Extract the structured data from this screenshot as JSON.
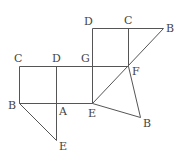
{
  "diagram": {
    "type": "geometry-figure",
    "labels": [
      {
        "id": "C1",
        "text": "C",
        "x": 14,
        "y": 53
      },
      {
        "id": "D1",
        "text": "D",
        "x": 52,
        "y": 53
      },
      {
        "id": "G",
        "text": "G",
        "x": 81,
        "y": 53
      },
      {
        "id": "B1",
        "text": "B",
        "x": 8,
        "y": 100
      },
      {
        "id": "A",
        "text": "A",
        "x": 59,
        "y": 106
      },
      {
        "id": "E1",
        "text": "E",
        "x": 88,
        "y": 108
      },
      {
        "id": "E2",
        "text": "E",
        "x": 59,
        "y": 141
      },
      {
        "id": "D2",
        "text": "D",
        "x": 84,
        "y": 16
      },
      {
        "id": "C2",
        "text": "C",
        "x": 124,
        "y": 15
      },
      {
        "id": "B2",
        "text": "B",
        "x": 166,
        "y": 23
      },
      {
        "id": "F",
        "text": "F",
        "x": 132,
        "y": 66
      },
      {
        "id": "B3",
        "text": "B",
        "x": 143,
        "y": 118
      }
    ],
    "segments": [
      {
        "from": [
          19,
          66
        ],
        "to": [
          128,
          66
        ]
      },
      {
        "from": [
          19,
          103
        ],
        "to": [
          92,
          103
        ]
      },
      {
        "from": [
          19,
          66
        ],
        "to": [
          19,
          103
        ]
      },
      {
        "from": [
          56,
          66
        ],
        "to": [
          56,
          140
        ]
      },
      {
        "from": [
          19,
          103
        ],
        "to": [
          56,
          140
        ]
      },
      {
        "from": [
          92,
          28
        ],
        "to": [
          92,
          103
        ]
      },
      {
        "from": [
          92,
          28
        ],
        "to": [
          163,
          28
        ]
      },
      {
        "from": [
          128,
          28
        ],
        "to": [
          128,
          66
        ]
      },
      {
        "from": [
          163,
          28
        ],
        "to": [
          92,
          103
        ]
      },
      {
        "from": [
          128,
          66
        ],
        "to": [
          140,
          117
        ]
      },
      {
        "from": [
          92,
          103
        ],
        "to": [
          140,
          117
        ]
      }
    ]
  }
}
